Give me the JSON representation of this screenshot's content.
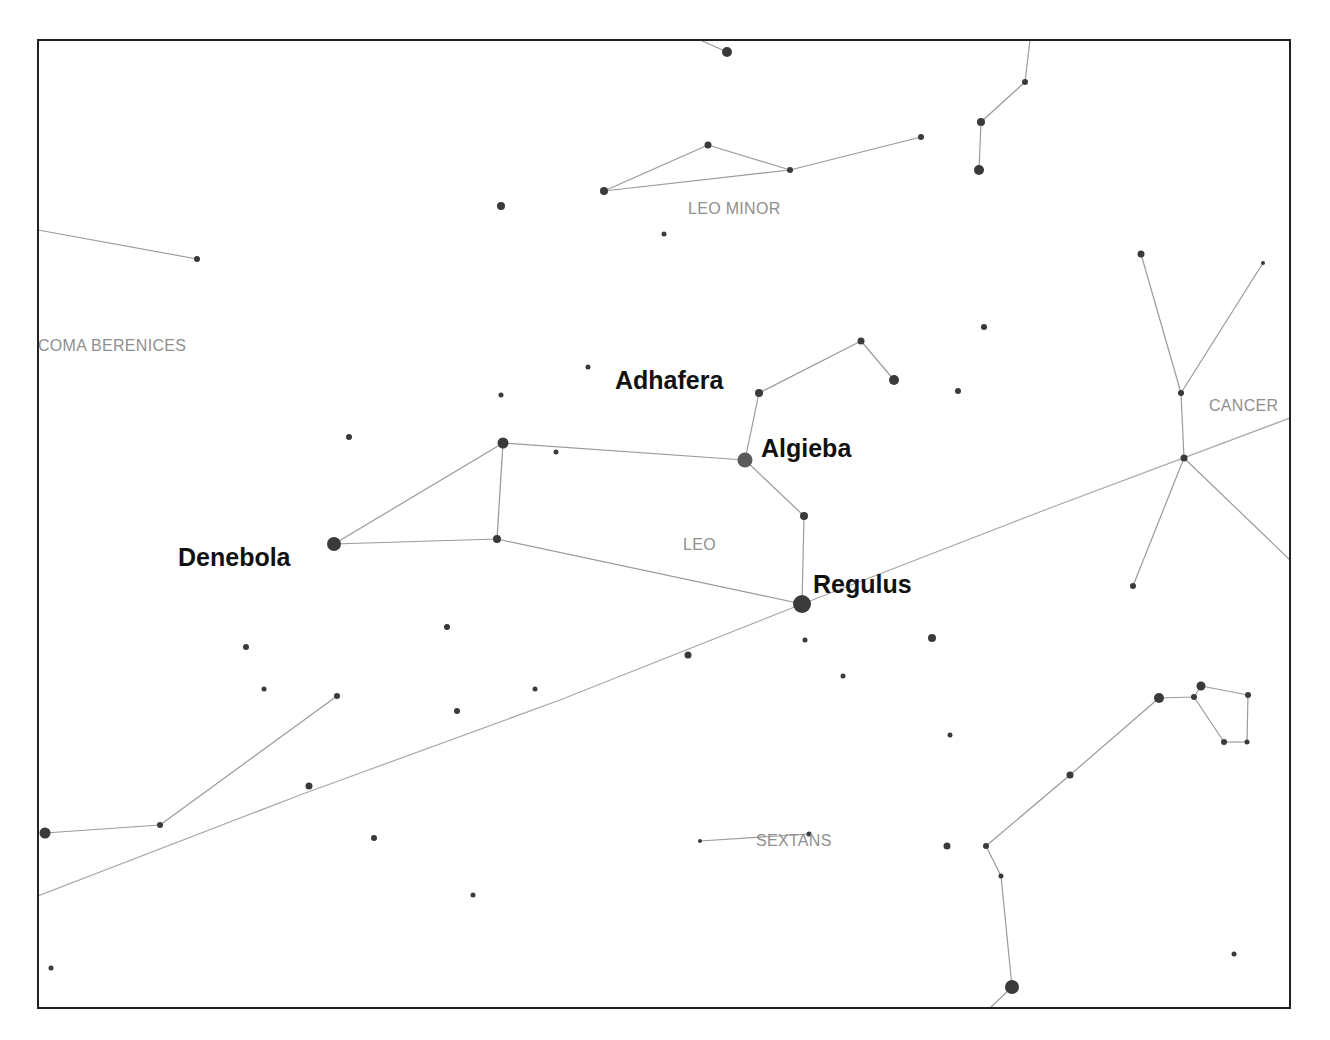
{
  "map": {
    "frame": {
      "x": 38,
      "y": 40,
      "width": 1252,
      "height": 968
    },
    "colors": {
      "frame": "#222222",
      "lines": "#9a9a9a",
      "stars": "#3a3a3a",
      "constellation_labels": "#8f8f8f",
      "star_labels": "#111111"
    },
    "constellation_labels": [
      {
        "id": "leo-minor",
        "text": "LEO MINOR",
        "x": 688,
        "y": 214
      },
      {
        "id": "coma-berenices",
        "text": "COMA BERENICES",
        "x": 38,
        "y": 351
      },
      {
        "id": "cancer",
        "text": "CANCER",
        "x": 1209,
        "y": 411
      },
      {
        "id": "leo",
        "text": "LEO",
        "x": 683,
        "y": 550
      },
      {
        "id": "sextans",
        "text": "SEXTANS",
        "x": 756,
        "y": 846
      }
    ],
    "star_labels": [
      {
        "id": "adhafera",
        "text": "Adhafera",
        "x": 615,
        "y": 389
      },
      {
        "id": "algieba",
        "text": "Algieba",
        "x": 761,
        "y": 457
      },
      {
        "id": "denebola",
        "text": "Denebola",
        "x": 178,
        "y": 566
      },
      {
        "id": "regulus",
        "text": "Regulus",
        "x": 813,
        "y": 593
      }
    ],
    "stars": [
      {
        "name": "Regulus",
        "x": 802,
        "y": 604,
        "r": 9
      },
      {
        "name": "Algieba",
        "x": 745,
        "y": 460,
        "r": 7.5
      },
      {
        "name": "Denebola",
        "x": 334,
        "y": 544,
        "r": 7
      },
      {
        "name": "Adhafera",
        "x": 759,
        "y": 393,
        "r": 4
      },
      {
        "name": "Zosma",
        "x": 503,
        "y": 443,
        "r": 5.5
      },
      {
        "name": "Chertan",
        "x": 497,
        "y": 539,
        "r": 4
      },
      {
        "name": "Ras Elased Borealis",
        "x": 861,
        "y": 341,
        "r": 3.5
      },
      {
        "name": "Ras Elased Australis",
        "x": 894,
        "y": 380,
        "r": 5
      },
      {
        "name": "Eta Leonis",
        "x": 804,
        "y": 516,
        "r": 4
      },
      {
        "name": "",
        "x": 727,
        "y": 52,
        "r": 5
      },
      {
        "name": "",
        "x": 708,
        "y": 145,
        "r": 3.5
      },
      {
        "name": "",
        "x": 790,
        "y": 170,
        "r": 3
      },
      {
        "name": "",
        "x": 604,
        "y": 191,
        "r": 4
      },
      {
        "name": "",
        "x": 921,
        "y": 137,
        "r": 3
      },
      {
        "name": "",
        "x": 1025,
        "y": 82,
        "r": 3
      },
      {
        "name": "",
        "x": 981,
        "y": 122,
        "r": 4
      },
      {
        "name": "",
        "x": 979,
        "y": 170,
        "r": 5
      },
      {
        "name": "",
        "x": 501,
        "y": 206,
        "r": 4
      },
      {
        "name": "",
        "x": 664,
        "y": 234,
        "r": 2.5
      },
      {
        "name": "",
        "x": 197,
        "y": 259,
        "r": 3
      },
      {
        "name": "",
        "x": 984,
        "y": 327,
        "r": 3
      },
      {
        "name": "",
        "x": 958,
        "y": 391,
        "r": 3
      },
      {
        "name": "",
        "x": 588,
        "y": 367,
        "r": 2.5
      },
      {
        "name": "",
        "x": 501,
        "y": 395,
        "r": 2.5
      },
      {
        "name": "",
        "x": 349,
        "y": 437,
        "r": 3
      },
      {
        "name": "",
        "x": 556,
        "y": 452,
        "r": 2.5
      },
      {
        "name": "",
        "x": 1141,
        "y": 254,
        "r": 3.5
      },
      {
        "name": "",
        "x": 1263,
        "y": 263,
        "r": 2
      },
      {
        "name": "",
        "x": 1181,
        "y": 393,
        "r": 3
      },
      {
        "name": "",
        "x": 1184,
        "y": 458,
        "r": 3.5
      },
      {
        "name": "",
        "x": 1133,
        "y": 586,
        "r": 3
      },
      {
        "name": "",
        "x": 447,
        "y": 627,
        "r": 3
      },
      {
        "name": "",
        "x": 246,
        "y": 647,
        "r": 3
      },
      {
        "name": "",
        "x": 264,
        "y": 689,
        "r": 2.5
      },
      {
        "name": "",
        "x": 337,
        "y": 696,
        "r": 3
      },
      {
        "name": "",
        "x": 535,
        "y": 689,
        "r": 2.5
      },
      {
        "name": "",
        "x": 457,
        "y": 711,
        "r": 3
      },
      {
        "name": "",
        "x": 688,
        "y": 655,
        "r": 3.5
      },
      {
        "name": "",
        "x": 805,
        "y": 640,
        "r": 2.5
      },
      {
        "name": "",
        "x": 932,
        "y": 638,
        "r": 4
      },
      {
        "name": "",
        "x": 843,
        "y": 676,
        "r": 2.5
      },
      {
        "name": "",
        "x": 950,
        "y": 735,
        "r": 2.5
      },
      {
        "name": "",
        "x": 309,
        "y": 786,
        "r": 3.5
      },
      {
        "name": "",
        "x": 160,
        "y": 825,
        "r": 3
      },
      {
        "name": "",
        "x": 45,
        "y": 833,
        "r": 5.5
      },
      {
        "name": "",
        "x": 374,
        "y": 838,
        "r": 3
      },
      {
        "name": "",
        "x": 473,
        "y": 895,
        "r": 2.5
      },
      {
        "name": "",
        "x": 51,
        "y": 968,
        "r": 2.5
      },
      {
        "name": "",
        "x": 700,
        "y": 841,
        "r": 2
      },
      {
        "name": "",
        "x": 809,
        "y": 834,
        "r": 2.5
      },
      {
        "name": "",
        "x": 947,
        "y": 846,
        "r": 3.5
      },
      {
        "name": "",
        "x": 986,
        "y": 846,
        "r": 3
      },
      {
        "name": "",
        "x": 1001,
        "y": 876,
        "r": 2.5
      },
      {
        "name": "",
        "x": 1012,
        "y": 987,
        "r": 7
      },
      {
        "name": "",
        "x": 1070,
        "y": 775,
        "r": 3.5
      },
      {
        "name": "",
        "x": 1159,
        "y": 698,
        "r": 5
      },
      {
        "name": "",
        "x": 1194,
        "y": 697,
        "r": 3
      },
      {
        "name": "",
        "x": 1201,
        "y": 686,
        "r": 4.5
      },
      {
        "name": "",
        "x": 1248,
        "y": 695,
        "r": 3
      },
      {
        "name": "",
        "x": 1224,
        "y": 742,
        "r": 3
      },
      {
        "name": "",
        "x": 1247,
        "y": 742,
        "r": 2.5
      },
      {
        "name": "",
        "x": 1234,
        "y": 954,
        "r": 2.5
      }
    ],
    "lines": [
      [
        [
          334,
          544
        ],
        [
          503,
          443
        ]
      ],
      [
        [
          334,
          544
        ],
        [
          497,
          539
        ]
      ],
      [
        [
          503,
          443
        ],
        [
          497,
          539
        ]
      ],
      [
        [
          503,
          443
        ],
        [
          745,
          460
        ]
      ],
      [
        [
          497,
          539
        ],
        [
          802,
          604
        ]
      ],
      [
        [
          745,
          460
        ],
        [
          759,
          393
        ]
      ],
      [
        [
          759,
          393
        ],
        [
          861,
          341
        ]
      ],
      [
        [
          861,
          341
        ],
        [
          894,
          380
        ]
      ],
      [
        [
          745,
          460
        ],
        [
          804,
          516
        ]
      ],
      [
        [
          804,
          516
        ],
        [
          802,
          604
        ]
      ],
      [
        [
          700,
          40
        ],
        [
          727,
          52
        ]
      ],
      [
        [
          604,
          191
        ],
        [
          708,
          145
        ]
      ],
      [
        [
          708,
          145
        ],
        [
          790,
          170
        ]
      ],
      [
        [
          604,
          191
        ],
        [
          790,
          170
        ]
      ],
      [
        [
          790,
          170
        ],
        [
          921,
          137
        ]
      ],
      [
        [
          1030,
          40
        ],
        [
          1025,
          82
        ]
      ],
      [
        [
          1025,
          82
        ],
        [
          981,
          122
        ]
      ],
      [
        [
          981,
          122
        ],
        [
          979,
          170
        ]
      ],
      [
        [
          38,
          230
        ],
        [
          197,
          259
        ]
      ],
      [
        [
          1141,
          254
        ],
        [
          1181,
          393
        ]
      ],
      [
        [
          1263,
          263
        ],
        [
          1181,
          393
        ]
      ],
      [
        [
          1181,
          393
        ],
        [
          1184,
          458
        ]
      ],
      [
        [
          1184,
          458
        ],
        [
          1133,
          586
        ]
      ],
      [
        [
          1184,
          458
        ],
        [
          1290,
          560
        ]
      ],
      [
        [
          45,
          833
        ],
        [
          160,
          825
        ]
      ],
      [
        [
          160,
          825
        ],
        [
          337,
          696
        ]
      ],
      [
        [
          700,
          841
        ],
        [
          809,
          834
        ]
      ],
      [
        [
          986,
          846
        ],
        [
          1001,
          876
        ]
      ],
      [
        [
          1001,
          876
        ],
        [
          1012,
          987
        ]
      ],
      [
        [
          1012,
          987
        ],
        [
          990,
          1008
        ]
      ],
      [
        [
          986,
          846
        ],
        [
          1070,
          775
        ]
      ],
      [
        [
          1070,
          775
        ],
        [
          1159,
          698
        ]
      ],
      [
        [
          1159,
          698
        ],
        [
          1194,
          697
        ]
      ],
      [
        [
          1194,
          697
        ],
        [
          1201,
          686
        ]
      ],
      [
        [
          1201,
          686
        ],
        [
          1248,
          695
        ]
      ],
      [
        [
          1248,
          695
        ],
        [
          1247,
          742
        ]
      ],
      [
        [
          1247,
          742
        ],
        [
          1224,
          742
        ]
      ],
      [
        [
          1224,
          742
        ],
        [
          1194,
          697
        ]
      ]
    ],
    "ecliptic": {
      "points": [
        [
          38,
          896
        ],
        [
          300,
          795
        ],
        [
          560,
          700
        ],
        [
          802,
          604
        ],
        [
          1050,
          508
        ],
        [
          1290,
          418
        ]
      ]
    }
  }
}
